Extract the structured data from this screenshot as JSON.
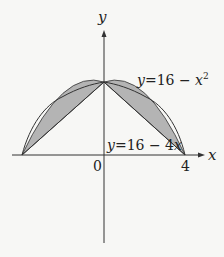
{
  "figure": {
    "axis_labels": {
      "x": "x",
      "y": "y"
    },
    "tick_labels": {
      "origin": "0",
      "x_right": "4"
    },
    "curves": [
      {
        "name": "parabola",
        "label": "y=16 − x²",
        "label_main": "y=16 − x",
        "label_sup": "2",
        "equation": "y = 16 - x^2"
      },
      {
        "name": "line",
        "label": "y=16 − 4x",
        "equation": "y = 16 - 4x"
      }
    ],
    "key_points": [
      {
        "label": "(0,16)",
        "x": 0,
        "y": 16
      },
      {
        "label": "(4,0)",
        "x": 4,
        "y": 0
      },
      {
        "label": "(-4,0)",
        "x": -4,
        "y": 0
      }
    ],
    "shaded_regions": "between y=16-x^2 and the chords from (0,16) to (±4,0)",
    "colors": {
      "fill": "#b4b4b4",
      "stroke": "#333333",
      "background": "#f7f7f5"
    }
  }
}
